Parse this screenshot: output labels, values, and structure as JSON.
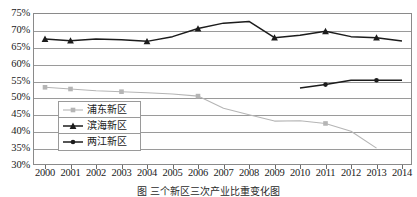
{
  "chart_data": {
    "type": "line",
    "title": "",
    "xlabel": "",
    "ylabel": "",
    "ylim": [
      30,
      75
    ],
    "ytick_step": 5,
    "ytick_labels": [
      "75%",
      "70%",
      "65%",
      "60%",
      "55%",
      "50%",
      "45%",
      "40%",
      "35%",
      "30%"
    ],
    "ytick_values": [
      75,
      70,
      65,
      60,
      55,
      50,
      45,
      40,
      35,
      30
    ],
    "grid": true,
    "legend_position": "inside-left",
    "x": [
      2000,
      2001,
      2002,
      2003,
      2004,
      2005,
      2006,
      2007,
      2008,
      2009,
      2010,
      2011,
      2012,
      2013,
      2014
    ],
    "xtick_labels": [
      "2000",
      "2001",
      "2002",
      "2003",
      "2004",
      "2005",
      "2006",
      "2007",
      "2008",
      "2009",
      "2010",
      "2011",
      "2012",
      "2013",
      "2014"
    ],
    "series": [
      {
        "name": "浦东新区",
        "color": "#b5b5b5",
        "marker": "square",
        "values": [
          53.0,
          52.5,
          52.0,
          51.7,
          51.4,
          51.0,
          50.4,
          46.8,
          44.9,
          43.0,
          43.1,
          42.3,
          40.0,
          35.0,
          null
        ]
      },
      {
        "name": "滨海新区",
        "color": "#1c1c1c",
        "marker": "triangle",
        "values": [
          67.3,
          66.8,
          67.3,
          67.1,
          66.6,
          68.0,
          70.4,
          72.0,
          72.5,
          67.7,
          68.4,
          69.6,
          68.0,
          67.7,
          66.7
        ]
      },
      {
        "name": "两江新区",
        "color": "#1c1c1c",
        "marker": "circle",
        "values": [
          null,
          null,
          null,
          null,
          null,
          null,
          null,
          null,
          null,
          null,
          52.8,
          53.8,
          55.1,
          55.1,
          55.1
        ]
      }
    ]
  },
  "legend": {
    "items": [
      {
        "label": "浦东新区",
        "color": "#b5b5b5",
        "marker": "square"
      },
      {
        "label": "滨海新区",
        "color": "#1c1c1c",
        "marker": "triangle"
      },
      {
        "label": "两江新区",
        "color": "#1c1c1c",
        "marker": "circle"
      }
    ]
  },
  "caption": "图  三个新区三次产业比重变化图"
}
